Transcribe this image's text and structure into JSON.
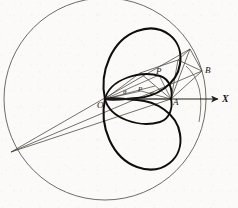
{
  "figure": {
    "curve_type": "cardioid",
    "colors": {
      "ink": "#161410",
      "thin_line": "#3b3833",
      "thick_curve": "#0d0b08",
      "paper": "#fbfaf8"
    },
    "points": [
      {
        "id": "O",
        "label": "O",
        "x": 105,
        "y": 99,
        "label_x": 98,
        "label_y": 103,
        "role": "pole-origin"
      },
      {
        "id": "A",
        "label": "A",
        "x": 171,
        "y": 99,
        "label_x": 173,
        "label_y": 102,
        "role": "cusp-vertex"
      },
      {
        "id": "P",
        "label": "P",
        "x": 159,
        "y": 75,
        "label_x": 157,
        "label_y": 71,
        "role": "curve-point-upper"
      },
      {
        "id": "P2",
        "label": "P",
        "x": 141,
        "y": 91,
        "label_x": 139,
        "label_y": 90,
        "role": "curve-point-inner"
      },
      {
        "id": "B",
        "label": "B",
        "x": 202,
        "y": 71,
        "label_x": 205,
        "label_y": 71,
        "role": "circle-point"
      }
    ],
    "angles": [
      {
        "id": "theta",
        "label": "θ",
        "label_x": 124,
        "label_y": 94,
        "vertex": "O"
      },
      {
        "id": "phi",
        "label": "φ",
        "label_x": 151,
        "label_y": 95,
        "vertex": "O"
      }
    ],
    "axis": {
      "label": "X",
      "label_x": 224,
      "label_y": 100,
      "from_x": 105,
      "from_y": 99,
      "to_x": 220,
      "to_y": 99,
      "arrowhead": true
    },
    "big_circle": {
      "cx": 105,
      "cy": 99,
      "r": 101,
      "stroke": "#5a564f",
      "width": 0.9
    },
    "small_arc": {
      "cx": 171,
      "cy": 99,
      "r": 34,
      "stroke": "#5a564f",
      "width": 0.8
    },
    "geometry_notes": {
      "upper_loop": "large oval from O sweeping up and right, tangent region near A",
      "lower_loop": "large oval from O sweeping down and right, mirror of upper loop",
      "lens": "inner lens/ellipse between O and A",
      "far_vertex": "two long chords converge at lower-left point on big circle",
      "upper_vertex": "chords converge at upper-right point on big circle"
    }
  }
}
